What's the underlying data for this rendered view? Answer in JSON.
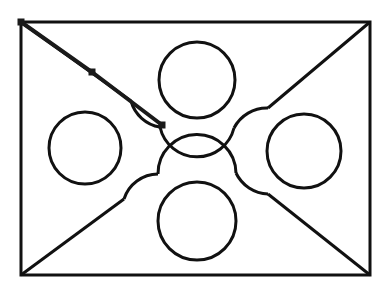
{
  "canvas": {
    "width": 381,
    "height": 302,
    "background_color": "#ffffff",
    "stroke_color": "#111111",
    "handle_color": "#1a1a1a",
    "title": "Vector drawing canvas"
  },
  "figure": {
    "frame": {
      "name": "outer-rectangle",
      "x": 21,
      "y": 22,
      "width": 349,
      "height": 253,
      "stroke_width": 3,
      "corners": [
        {
          "label": "top-left",
          "x": 21,
          "y": 22
        },
        {
          "label": "top-right",
          "x": 370,
          "y": 22
        },
        {
          "label": "bottom-right",
          "x": 370,
          "y": 275
        },
        {
          "label": "bottom-left",
          "x": 21,
          "y": 275
        }
      ]
    },
    "circles": [
      {
        "name": "circle-top",
        "cx": 197,
        "cy": 80,
        "r": 38,
        "stroke_width": 3
      },
      {
        "name": "circle-left",
        "cx": 85,
        "cy": 148,
        "r": 36,
        "stroke_width": 3
      },
      {
        "name": "circle-right",
        "cx": 304,
        "cy": 151,
        "r": 37,
        "stroke_width": 3
      },
      {
        "name": "circle-bottom",
        "cx": 197,
        "cy": 221,
        "r": 39,
        "stroke_width": 3
      }
    ],
    "star": {
      "name": "curved-star",
      "stroke_width": 3,
      "description": "Concave four-pointed star whose sides are arcs of the four circles"
    },
    "diagonals": [
      {
        "name": "diagonal-top-left",
        "from_x": 21,
        "from_y": 22,
        "to_x": 150,
        "to_y": 115
      },
      {
        "name": "diagonal-top-right",
        "from_x": 370,
        "from_y": 22,
        "to_x": 243,
        "to_y": 116
      },
      {
        "name": "diagonal-bottom-left",
        "from_x": 21,
        "from_y": 275,
        "to_x": 150,
        "to_y": 186
      },
      {
        "name": "diagonal-bottom-right",
        "from_x": 370,
        "from_y": 275,
        "to_x": 243,
        "to_y": 186
      }
    ]
  },
  "selection": {
    "name": "selected-path",
    "stroke_width": 4,
    "stroke_color": "#1a1a1a",
    "handle_size": 7,
    "handles": [
      {
        "name": "handle-start",
        "x": 21,
        "y": 22,
        "label": "start node"
      },
      {
        "name": "handle-mid",
        "x": 92,
        "y": 72,
        "label": "mid node"
      },
      {
        "name": "handle-end",
        "x": 162,
        "y": 125,
        "label": "end node"
      }
    ],
    "segment_points": "21,22 92,72 162,125"
  }
}
